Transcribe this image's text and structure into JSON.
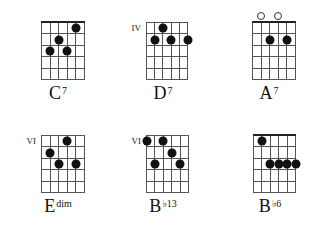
{
  "diagram": {
    "strings": 6,
    "frets_shown": 5,
    "chords": [
      {
        "root": "C",
        "suffix": "7",
        "position_label": "",
        "nut": true,
        "open_strings": [],
        "dots": [
          {
            "string": 2,
            "fret": 3
          },
          {
            "string": 3,
            "fret": 2
          },
          {
            "string": 4,
            "fret": 3
          },
          {
            "string": 5,
            "fret": 1
          }
        ]
      },
      {
        "root": "D",
        "suffix": "7",
        "position_label": "IV",
        "nut": false,
        "open_strings": [],
        "dots": [
          {
            "string": 3,
            "fret": 1
          },
          {
            "string": 2,
            "fret": 2
          },
          {
            "string": 4,
            "fret": 2
          },
          {
            "string": 6,
            "fret": 2
          }
        ]
      },
      {
        "root": "A",
        "suffix": "7",
        "position_label": "",
        "nut": true,
        "open_strings": [
          2,
          4
        ],
        "dots": [
          {
            "string": 3,
            "fret": 2
          },
          {
            "string": 5,
            "fret": 2
          }
        ]
      },
      {
        "root": "E",
        "suffix": "dim",
        "position_label": "VI",
        "nut": false,
        "open_strings": [],
        "dots": [
          {
            "string": 4,
            "fret": 1
          },
          {
            "string": 2,
            "fret": 2
          },
          {
            "string": 3,
            "fret": 3
          },
          {
            "string": 5,
            "fret": 3
          }
        ]
      },
      {
        "root": "B",
        "suffix": "♭13",
        "position_label": "VI",
        "nut": false,
        "open_strings": [],
        "dots": [
          {
            "string": 1,
            "fret": 1
          },
          {
            "string": 3,
            "fret": 1
          },
          {
            "string": 4,
            "fret": 2
          },
          {
            "string": 2,
            "fret": 3
          },
          {
            "string": 5,
            "fret": 3
          }
        ]
      },
      {
        "root": "B",
        "suffix": "♭6",
        "position_label": "",
        "nut": true,
        "open_strings": [],
        "dots": [
          {
            "string": 2,
            "fret": 1
          },
          {
            "string": 3,
            "fret": 3
          },
          {
            "string": 4,
            "fret": 3
          },
          {
            "string": 5,
            "fret": 3
          },
          {
            "string": 6,
            "fret": 3
          }
        ]
      }
    ]
  }
}
